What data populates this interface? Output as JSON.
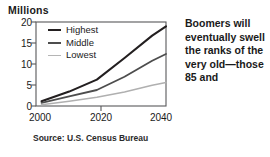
{
  "chart_data": {
    "type": "line",
    "title": "",
    "subtitle": "",
    "unit_label": "Millions",
    "xlabel": "",
    "ylabel": "Millions",
    "xlim": [
      1998,
      2045
    ],
    "ylim": [
      0,
      21
    ],
    "grid": false,
    "legend_position": "inside-top-left",
    "x": [
      2000,
      2010,
      2020,
      2030,
      2040,
      2045
    ],
    "xticks": [
      2000,
      2020,
      2040
    ],
    "xtick_labels": [
      "2000",
      "2020",
      "2040"
    ],
    "yticks": [
      0,
      5,
      10,
      15,
      20
    ],
    "ytick_labels": [
      "0",
      "5",
      "10",
      "15",
      "20"
    ],
    "series": [
      {
        "name": "Highest",
        "color": "#231f20",
        "width": 2.1,
        "values": [
          1.2,
          3.6,
          6.6,
          12.0,
          17.6,
          19.9
        ]
      },
      {
        "name": "Middle",
        "color": "#4d4d4d",
        "width": 1.8,
        "values": [
          0.8,
          2.4,
          4.0,
          7.3,
          11.3,
          13.0
        ]
      },
      {
        "name": "Lowest",
        "color": "#b0b0b0",
        "width": 1.5,
        "values": [
          0.3,
          1.2,
          2.2,
          3.5,
          5.2,
          5.9
        ]
      }
    ],
    "source": "Source: U.S. Census Bureau",
    "axis_color": "#58585a",
    "frame": true
  },
  "legend": {
    "items": [
      {
        "label": "Highest",
        "color": "#231f20",
        "thickness": "2.2px"
      },
      {
        "label": "Middle",
        "color": "#4d4d4d",
        "thickness": "1.9px"
      },
      {
        "label": "Lowest",
        "color": "#b5b5b5",
        "thickness": "1.4px"
      }
    ]
  },
  "caption": {
    "text": "Boomers will eventually swell the ranks of the very old—those 85 and"
  },
  "axis": {
    "unit_label": "Millions",
    "x_labels": [
      "2000",
      "2020",
      "2040"
    ],
    "y_labels": [
      "20",
      "15",
      "10",
      "5",
      "0"
    ]
  },
  "source": {
    "text": "Source: U.S. Census Bureau"
  }
}
